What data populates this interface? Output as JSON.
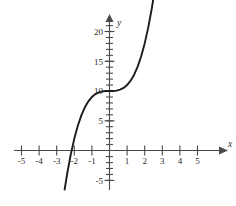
{
  "chart_data": {
    "type": "line",
    "title": "",
    "xlabel": "x",
    "ylabel": "y",
    "grid": false,
    "legend": null,
    "xlim": [
      -5.8,
      5.9
    ],
    "ylim": [
      -7.5,
      22.5
    ],
    "x_ticks_major": [
      -5,
      -4,
      -3,
      -2,
      -1,
      1,
      2,
      3,
      4,
      5
    ],
    "x_tick_labels": [
      "-5",
      "-4",
      "-3",
      "-2",
      "-1",
      "1",
      "2",
      "3",
      "4",
      "5"
    ],
    "y_ticks_major": [
      -5,
      5,
      10,
      15,
      20
    ],
    "y_tick_labels": [
      "-5",
      "5",
      "10",
      "15",
      "20"
    ],
    "x_minor_tick_step": 1,
    "y_minor_tick_step": 1,
    "function": "y = x^3 + 10",
    "series": [
      {
        "name": "y = x^3 + 10",
        "x": [
          -2.55,
          -2.4,
          -2.2,
          -2.0,
          -1.8,
          -1.6,
          -1.4,
          -1.2,
          -1.0,
          -0.8,
          -0.6,
          -0.4,
          -0.2,
          0.0,
          0.2,
          0.4,
          0.6,
          0.8,
          1.0,
          1.2,
          1.4,
          1.6,
          1.8,
          2.0,
          2.2,
          2.4,
          2.55
        ],
        "y": [
          -6.58,
          -3.82,
          -0.65,
          2.0,
          4.17,
          5.9,
          7.26,
          8.27,
          9.0,
          9.49,
          9.78,
          9.94,
          9.99,
          10.0,
          10.01,
          10.06,
          10.22,
          10.51,
          11.0,
          11.73,
          12.74,
          14.1,
          15.83,
          18.0,
          20.65,
          23.82,
          26.58
        ]
      }
    ],
    "x_intercept": -2.154,
    "y_intercept": 10,
    "inflection_point": [
      0,
      10
    ]
  },
  "axis_labels": {
    "x_name": "x",
    "y_name": "y"
  }
}
